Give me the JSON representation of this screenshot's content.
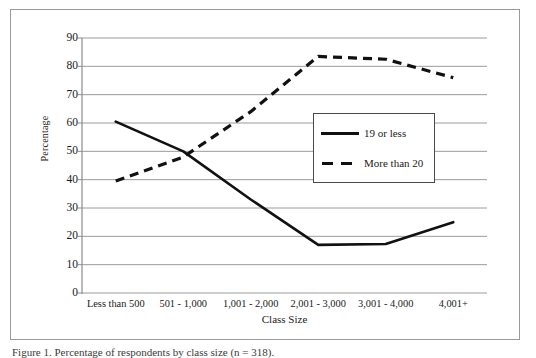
{
  "figure": {
    "caption": "Figure 1. Percentage of respondents by class size (n = 318)."
  },
  "chart_data": {
    "type": "line",
    "title": "",
    "xlabel": "Class Size",
    "ylabel": "Percentage",
    "categories": [
      "Less than 500",
      "501 - 1,000",
      "1,001 - 2,000",
      "2,001 - 3,000",
      "3,001 - 4,000",
      "4,001+"
    ],
    "series": [
      {
        "name": "19 or less",
        "style": "solid",
        "color": "#111111",
        "values": [
          60.5,
          50.0,
          33.0,
          17.0,
          17.3,
          25.0
        ]
      },
      {
        "name": "More than 20",
        "style": "dashed",
        "color": "#111111",
        "values": [
          39.5,
          48.0,
          64.0,
          83.5,
          82.5,
          76.0
        ]
      }
    ],
    "ylim": [
      0,
      90
    ],
    "ytick_labels": [
      "90",
      "80",
      "70",
      "60",
      "50",
      "40",
      "30",
      "20",
      "10",
      "0"
    ],
    "ytick_values": [
      90,
      80,
      70,
      60,
      50,
      40,
      30,
      20,
      10,
      0
    ],
    "grid": true,
    "grid_color": "#9a9a9a",
    "legend_position": "upper-right-inside"
  },
  "legend": {
    "entries": [
      {
        "label": "19 or less",
        "marker": "solid-line-swatch"
      },
      {
        "label": "More than 20",
        "marker": "dashed-line-swatch"
      }
    ]
  }
}
